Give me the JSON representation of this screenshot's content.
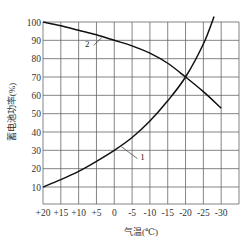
{
  "chart_data": {
    "type": "line",
    "title": "",
    "xlabel": "气温(℃)",
    "ylabel": "蓄电池功率(%)",
    "x_ticks": [
      "+20",
      "+15",
      "+10",
      "+5",
      "0",
      "-5",
      "-10",
      "-15",
      "-20",
      "-25",
      "-30"
    ],
    "x": [
      20,
      15,
      10,
      5,
      0,
      -5,
      -10,
      -15,
      -20,
      -25,
      -30
    ],
    "y_ticks": [
      "100",
      "90",
      "80",
      "70",
      "60",
      "50",
      "40",
      "30",
      "20",
      "10"
    ],
    "xlim": [
      20,
      -32
    ],
    "ylim": [
      5,
      100
    ],
    "grid": true,
    "legend": "inline curve labels",
    "series": [
      {
        "name": "1",
        "x": [
          20,
          15,
          10,
          5,
          0,
          -5,
          -10,
          -15,
          -20,
          -25,
          -28
        ],
        "values": [
          10,
          14,
          18.5,
          24,
          30,
          37,
          46,
          57,
          70,
          88,
          103
        ]
      },
      {
        "name": "2",
        "x": [
          20,
          15,
          10,
          5,
          0,
          -5,
          -10,
          -15,
          -20,
          -25,
          -30
        ],
        "values": [
          100,
          98,
          95.5,
          93,
          90,
          87,
          83,
          77.5,
          70,
          62,
          53
        ]
      }
    ],
    "annotations": [
      {
        "text": "1",
        "target_series": "1",
        "near_x": -3,
        "near_y": 28
      },
      {
        "text": "2",
        "target_series": "2",
        "near_x": 2,
        "near_y": 86
      }
    ]
  }
}
